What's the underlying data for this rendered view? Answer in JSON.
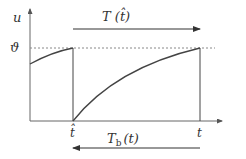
{
  "diagram": {
    "y_axis_label": "u",
    "threshold_label": "ϑ",
    "top_arrow_label": "T (t̂)",
    "bottom_arrow_label_main": "T",
    "bottom_arrow_label_sub": "b",
    "bottom_arrow_label_arg": "(t)",
    "x_tick_1": "t̂",
    "x_tick_2": "t",
    "colors": {
      "line": "#444444",
      "dotted": "#888888",
      "text": "#333333"
    }
  }
}
